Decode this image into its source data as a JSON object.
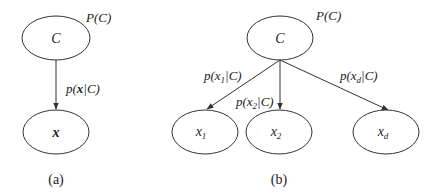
{
  "panel_a": {
    "caption": "(a)",
    "nodes": {
      "class": {
        "label": "C",
        "prior": "P(C)"
      },
      "feature": {
        "label": "x"
      }
    },
    "edges": [
      {
        "from": "C",
        "to": "x",
        "label_prefix": "p(",
        "label_var": "x",
        "label_suffix": "|C)"
      }
    ]
  },
  "panel_b": {
    "caption": "(b)",
    "nodes": {
      "class": {
        "label": "C",
        "prior": "P(C)"
      },
      "features": [
        {
          "base": "x",
          "sub": "1"
        },
        {
          "base": "x",
          "sub": "2"
        },
        {
          "base": "x",
          "sub": "d"
        }
      ]
    },
    "edges": [
      {
        "to": "x1",
        "prefix": "p(x",
        "sub": "1",
        "suffix": "|C)"
      },
      {
        "to": "x2",
        "prefix": "p(x",
        "sub": "2",
        "suffix": "|C)"
      },
      {
        "to": "xd",
        "prefix": "p(x",
        "sub": "d",
        "suffix": "|C)"
      }
    ]
  },
  "colors": {
    "stroke": "#333333",
    "text": "#222222",
    "background": "#ffffff"
  }
}
